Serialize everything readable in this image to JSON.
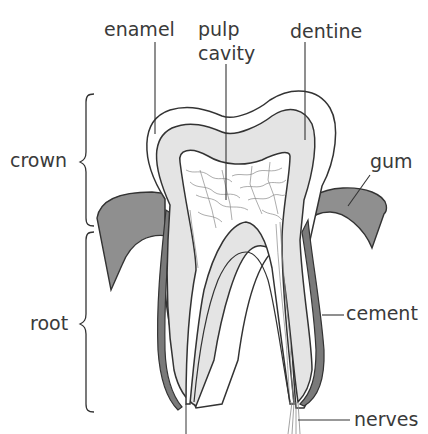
{
  "labels": {
    "enamel": "enamel",
    "pulp_line1": "pulp",
    "pulp_line2": "cavity",
    "dentine": "dentine",
    "crown": "crown",
    "gum": "gum",
    "root": "root",
    "cement": "cement",
    "nerves": "nerves"
  },
  "regions": {
    "crown": "crown",
    "root": "root"
  },
  "colors": {
    "outline": "#333333",
    "dentine_fill": "#e4e4e4",
    "enamel_fill": "#ffffff",
    "gum_fill": "#8f8f8f",
    "cement_fill": "#7a7a7a",
    "pulp_vessels": "#8a8a8a",
    "text": "#3a3a3a"
  }
}
